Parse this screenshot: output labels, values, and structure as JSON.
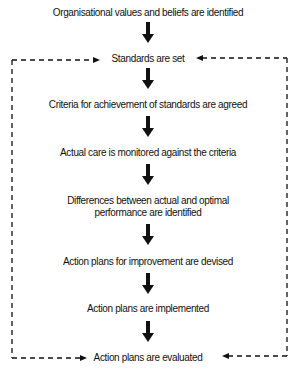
{
  "diagram": {
    "type": "flowchart",
    "steps": [
      {
        "label": "Organisational values and beliefs are identified"
      },
      {
        "label": "Standards are set"
      },
      {
        "label": "Criteria for achievement of standards are agreed"
      },
      {
        "label": "Actual care is monitored against the criteria"
      },
      {
        "label": "Differences between actual and optimal",
        "label2": "performance are identified"
      },
      {
        "label": "Action plans for improvement are devised"
      },
      {
        "label": "Action plans are implemented"
      },
      {
        "label": "Action plans are evaluated"
      }
    ],
    "feedback_loop": {
      "from": "Action plans are evaluated",
      "to": "Standards are set",
      "style": "dashed"
    },
    "colors": {
      "line": "#111111",
      "background": "#ffffff"
    }
  }
}
